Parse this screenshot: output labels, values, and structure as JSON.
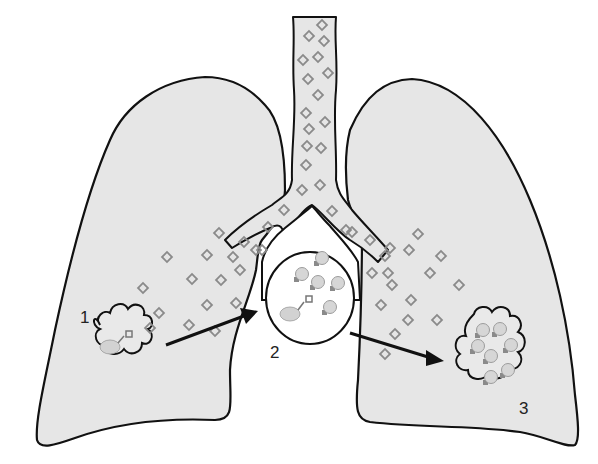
{
  "figure": {
    "labels": [
      {
        "id": "stage-1",
        "text": "1"
      },
      {
        "id": "stage-2",
        "text": "2"
      },
      {
        "id": "stage-3",
        "text": "3"
      }
    ],
    "colors": {
      "lung_fill": "#e6e6e6",
      "outline": "#111111",
      "particle": "#8a8a8a",
      "background": "#ffffff"
    },
    "components": {
      "left_lung": "left-lung",
      "right_lung": "right-lung",
      "trachea": "trachea",
      "lymph_node": "lymph-node-circle",
      "primary_lesion": "stage-1-lesion",
      "secondary_lesion": "stage-3-lesion",
      "arrows": [
        "arrow-1-to-2",
        "arrow-2-to-3"
      ]
    },
    "counts": {
      "bacteria_in_circle": 5,
      "bacteria_in_stage_3": 7
    }
  }
}
